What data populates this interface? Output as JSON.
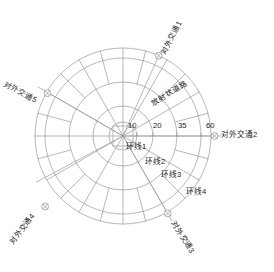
{
  "diagram": {
    "title_radial_roads": "放射状道路",
    "center": {
      "x": 123,
      "y": 136
    },
    "ring_labels": [
      {
        "text": "环线1",
        "x": 126,
        "y": 148
      },
      {
        "text": "环线2",
        "x": 146,
        "y": 162
      },
      {
        "text": "环线3",
        "x": 162,
        "y": 175
      },
      {
        "text": "环线4",
        "x": 185,
        "y": 191
      }
    ],
    "tick_labels": [
      {
        "text": "10",
        "x": 127,
        "y": 127
      },
      {
        "text": "20",
        "x": 152,
        "y": 127
      },
      {
        "text": "35",
        "x": 177,
        "y": 127
      },
      {
        "text": "60",
        "x": 207,
        "y": 127
      }
    ],
    "external_labels": [
      {
        "text": "对外交通1",
        "x": 153,
        "y": 5,
        "rotate": -62
      },
      {
        "text": "对外交通2",
        "x": 224,
        "y": 130,
        "rotate": 0
      },
      {
        "text": "对外交通3",
        "x": 176,
        "y": 221,
        "rotate": 58
      },
      {
        "text": "对外交通4",
        "x": 17,
        "y": 209,
        "rotate": -52
      },
      {
        "text": "对外交通5",
        "x": 6,
        "y": 73,
        "rotate": 28
      }
    ],
    "radial_label": {
      "text": "放射状道路",
      "x": 158,
      "y": 103,
      "rotate": -31
    },
    "rings": [
      {
        "name": "环线1",
        "radius_px": 14,
        "value": 10
      },
      {
        "name": "环线2",
        "radius_px": 30,
        "value": 20
      },
      {
        "name": "环线3",
        "radius_px": 54,
        "value": 35
      },
      {
        "name": "环线4",
        "radius_px": 78,
        "value": 60
      }
    ],
    "outer_boundary_radius_px": 88,
    "colors": {
      "line": "#9a9a9a",
      "text": "#1a1a1a",
      "background": "#ffffff",
      "node": "#8c8c8c"
    },
    "spoke_count": 12,
    "external_nodes": [
      {
        "label": "对外交通1",
        "angle_deg": -66
      },
      {
        "label": "对外交通2",
        "angle_deg": 0
      },
      {
        "label": "对外交通3",
        "angle_deg": 60
      },
      {
        "label": "对外交通4",
        "angle_deg": 208
      },
      {
        "label": "对外交通5",
        "angle_deg": 150
      }
    ]
  }
}
